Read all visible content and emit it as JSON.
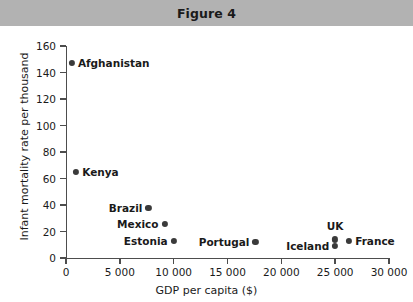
{
  "header": {
    "title": "Figure 4"
  },
  "chart_data": {
    "type": "scatter",
    "title": "Figure 4",
    "xlabel": "GDP per capita ($)",
    "ylabel": "Infant mortality rate per thousand",
    "xlim": [
      0,
      30000
    ],
    "ylim": [
      0,
      160
    ],
    "grid": false,
    "legend": "none",
    "x_ticks": [
      0,
      5000,
      10000,
      15000,
      20000,
      25000,
      30000
    ],
    "x_tick_labels": [
      "0",
      "5 000",
      "10 000",
      "15 000",
      "20 000",
      "25 000",
      "30 000"
    ],
    "y_ticks": [
      0,
      20,
      40,
      60,
      80,
      100,
      120,
      140,
      160
    ],
    "y_tick_labels": [
      "0",
      "20",
      "40",
      "60",
      "80",
      "100",
      "120",
      "140",
      "160"
    ],
    "point_color": "#3a3a3a",
    "points": [
      {
        "label": "Afghanistan",
        "x": 550,
        "y": 147,
        "label_pos": "right"
      },
      {
        "label": "Kenya",
        "x": 950,
        "y": 65,
        "label_pos": "right"
      },
      {
        "label": "Brazil",
        "x": 7650,
        "y": 38,
        "label_pos": "left"
      },
      {
        "label": "Mexico",
        "x": 9150,
        "y": 26,
        "label_pos": "left"
      },
      {
        "label": "Estonia",
        "x": 10000,
        "y": 13,
        "label_pos": "left"
      },
      {
        "label": "Portugal",
        "x": 17600,
        "y": 12,
        "label_pos": "left"
      },
      {
        "label": "Iceland",
        "x": 25000,
        "y": 9,
        "label_pos": "left"
      },
      {
        "label": "UK",
        "x": 25000,
        "y": 14,
        "label_pos": "above"
      },
      {
        "label": "France",
        "x": 26300,
        "y": 13,
        "label_pos": "right"
      }
    ]
  }
}
